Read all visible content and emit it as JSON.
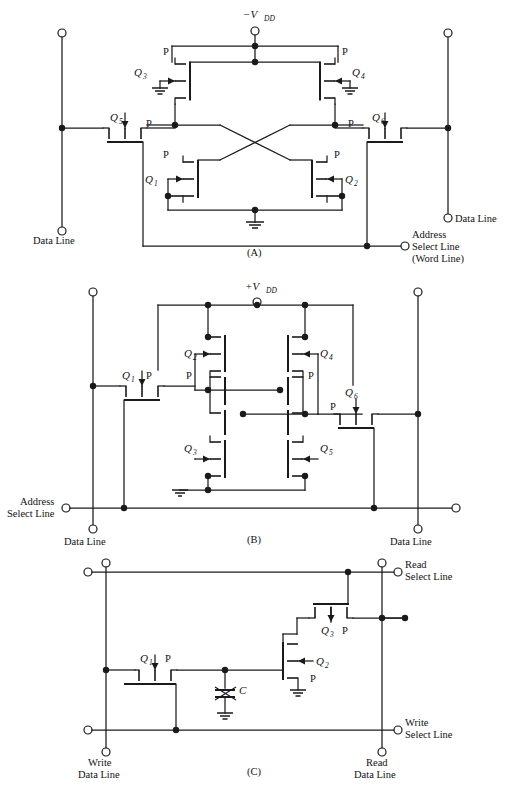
{
  "figure": {
    "panels": [
      {
        "id": "A",
        "caption": "(A)",
        "supply_label": "−V",
        "supply_sub": "DD",
        "transistors": [
          "Q1",
          "Q2",
          "Q3",
          "Q4",
          "Q5",
          "Q6"
        ],
        "channel_markers": [
          "P",
          "P",
          "P",
          "P",
          "P",
          "P",
          "P",
          "P"
        ],
        "terminal_labels": [
          {
            "name": "data-line-left",
            "text": "Data Line"
          },
          {
            "name": "data-line-right",
            "text": "Data Line"
          },
          {
            "name": "address-select-line",
            "line1": "Address",
            "line2": "Select Line",
            "line3": "(Word Line)"
          }
        ]
      },
      {
        "id": "B",
        "caption": "(B)",
        "supply_label": "+V",
        "supply_sub": "DD",
        "transistors": [
          "Q1",
          "Q2",
          "Q3",
          "Q4",
          "Q5",
          "Q6"
        ],
        "channel_markers": [
          "P",
          "P",
          "P",
          "P",
          "P"
        ],
        "terminal_labels": [
          {
            "name": "address-select-line",
            "line1": "Address",
            "line2": "Select Line"
          },
          {
            "name": "data-line-left",
            "text": "Data Line"
          },
          {
            "name": "data-line-right",
            "text": "Data Line"
          }
        ]
      },
      {
        "id": "C",
        "caption": "(C)",
        "transistors": [
          "Q1",
          "Q2",
          "Q3"
        ],
        "capacitor_label": "C",
        "channel_markers": [
          "P",
          "P",
          "P"
        ],
        "terminal_labels": [
          {
            "name": "read-select-line",
            "line1": "Read",
            "line2": "Select Line"
          },
          {
            "name": "write-select-line",
            "line1": "Write",
            "line2": "Select Line"
          },
          {
            "name": "write-data-line",
            "line1": "Write",
            "line2": "Data Line"
          },
          {
            "name": "read-data-line",
            "line1": "Read",
            "line2": "Data Line"
          }
        ]
      }
    ]
  },
  "labels": {
    "q1": "Q",
    "q2": "Q",
    "q3": "Q",
    "q4": "Q",
    "q5": "Q",
    "q6": "Q",
    "s1": "1",
    "s2": "2",
    "s3": "3",
    "s4": "4",
    "s5": "5",
    "s6": "6",
    "P": "P",
    "C": "C",
    "vdd_neg": "−V",
    "vdd_pos": "+V",
    "dd": "DD",
    "data_line": "Data Line",
    "address": "Address",
    "select_line": "Select Line",
    "word_line": "(Word Line)",
    "read": "Read",
    "write": "Write",
    "write_data_1": "Write",
    "write_data_2": "Data Line",
    "read_data_1": "Read",
    "read_data_2": "Data Line",
    "panelA": "(A)",
    "panelB": "(B)",
    "panelC": "(C)"
  },
  "colors": {
    "ink": "#1a1a1a",
    "background": "#ffffff"
  }
}
